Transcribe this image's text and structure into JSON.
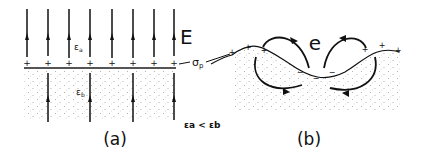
{
  "panel_a": {
    "caption": "(a)",
    "field_label": "E",
    "upper_medium": "ε",
    "upper_sub": "a",
    "lower_medium": "ε",
    "lower_sub": "b",
    "surface_charge": "σ",
    "surface_charge_sub": "p",
    "condition": "εa < εb",
    "charge_sign": "+"
  },
  "panel_b": {
    "caption": "(b)",
    "field_label": "e",
    "positive_sign": "+",
    "negative_sign": "−"
  },
  "colors": {
    "ink": "#111111",
    "stipple": "#9a9a9a",
    "background": "#ffffff"
  }
}
